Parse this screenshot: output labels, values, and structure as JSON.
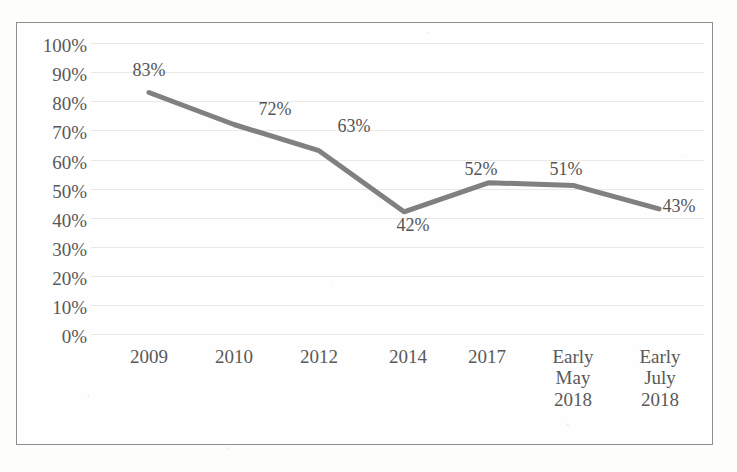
{
  "chart_data": {
    "type": "line",
    "title": "",
    "subtitle": "",
    "xlabel": "",
    "ylabel": "",
    "categories": [
      "2009",
      "2010",
      "2012",
      "2014",
      "2017",
      "Early\nMay\n2018",
      "Early\nJuly\n2018"
    ],
    "values": [
      83,
      72,
      63,
      42,
      52,
      51,
      43
    ],
    "data_labels": [
      "83%",
      "72%",
      "63%",
      "42%",
      "52%",
      "51%",
      "43%"
    ],
    "ylim": [
      0,
      100
    ],
    "ytick_labels": [
      "100%",
      "90%",
      "80%",
      "70%",
      "60%",
      "50%",
      "40%",
      "30%",
      "20%",
      "10%",
      "0%"
    ],
    "ytick_values": [
      100,
      90,
      80,
      70,
      60,
      50,
      40,
      30,
      20,
      10,
      0
    ],
    "grid": true,
    "legend": false,
    "legend_position": "none",
    "series": [
      {
        "name": "",
        "values": [
          83,
          72,
          63,
          42,
          52,
          51,
          43
        ],
        "color": "#808080"
      }
    ],
    "annotations": []
  },
  "style": {
    "line_color": "#808080",
    "gridline_color": "#ebe9e6",
    "border_color": "#8e8e8e",
    "text_color": "#595959",
    "background_color": "#fdfdfb",
    "plot_background_color": "#fefefe"
  }
}
